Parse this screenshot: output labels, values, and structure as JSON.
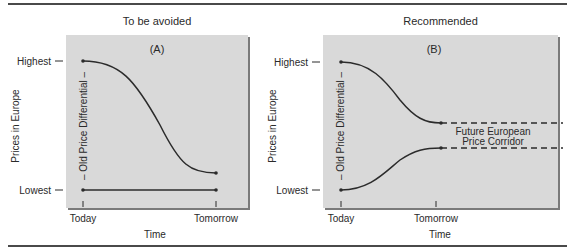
{
  "figure": {
    "panels": [
      {
        "id": "A",
        "heading": "To be avoided",
        "tag": "(A)",
        "y_axis_label": "Prices in Europe",
        "y_ticks": [
          "Highest",
          "Lowest"
        ],
        "x_ticks": [
          "Today",
          "Tomorrow"
        ],
        "x_axis_label": "Time",
        "differential_label": "– Old Price Differential –"
      },
      {
        "id": "B",
        "heading": "Recommended",
        "tag": "(B)",
        "y_axis_label": "Prices in Europe",
        "y_ticks": [
          "Highest",
          "Lowest"
        ],
        "x_ticks": [
          "Today",
          "Tomorrow"
        ],
        "x_axis_label": "Time",
        "differential_label": "– Old Price Differential –",
        "corridor_label_line1": "Future European",
        "corridor_label_line2": "Price Corridor"
      }
    ],
    "colors": {
      "panel_bg": "#d9d9d9",
      "panel_shadow": "#7a7a7a",
      "line": "#2b2b2b",
      "rule": "#4a4a4a"
    }
  }
}
